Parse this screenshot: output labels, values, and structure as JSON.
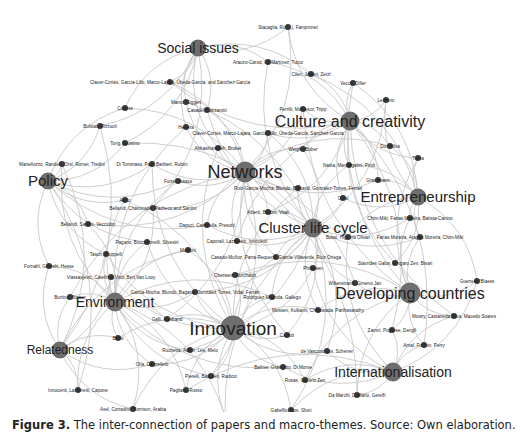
{
  "figure": {
    "caption_label": "Figure 3.",
    "caption_text": " The inter-connection of papers and macro-themes. Source: Own elaboration."
  },
  "colors": {
    "edge": "#c8c8c8",
    "theme_node": "#6e6e6e",
    "paper_node": "#3a3a3a",
    "label": "#222222"
  },
  "themes": [
    {
      "id": "social",
      "label": "Social issues",
      "x": 198,
      "y": 48,
      "r": 8,
      "fs": 14
    },
    {
      "id": "culture",
      "label": "Culture and creativity",
      "x": 350,
      "y": 121,
      "r": 9,
      "fs": 16
    },
    {
      "id": "policy",
      "label": "Policy",
      "x": 48,
      "y": 181,
      "r": 8,
      "fs": 15
    },
    {
      "id": "networks",
      "label": "Networks",
      "x": 245,
      "y": 172,
      "r": 10,
      "fs": 18
    },
    {
      "id": "entre",
      "label": "Entrepreneurship",
      "x": 418,
      "y": 197,
      "r": 8,
      "fs": 15
    },
    {
      "id": "cluster",
      "label": "Cluster life cycle",
      "x": 313,
      "y": 228,
      "r": 9,
      "fs": 15
    },
    {
      "id": "developing",
      "label": "Developing countries",
      "x": 410,
      "y": 293,
      "r": 10,
      "fs": 16
    },
    {
      "id": "environment",
      "label": "Environment",
      "x": 115,
      "y": 302,
      "r": 9,
      "fs": 14
    },
    {
      "id": "innovation",
      "label": "Innovation",
      "x": 233,
      "y": 328,
      "r": 12,
      "fs": 19
    },
    {
      "id": "relatedness",
      "label": "Relatedness",
      "x": 60,
      "y": 350,
      "r": 8,
      "fs": 12
    },
    {
      "id": "intl",
      "label": "Internationalisation",
      "x": 393,
      "y": 372,
      "r": 9,
      "fs": 14
    }
  ],
  "papers": [
    {
      "label": "Stacaglia, Ro(…), Fampronet",
      "x": 288,
      "y": 27
    },
    {
      "label": "Arauzo-Carod, Gil-Martínez, Turco",
      "x": 268,
      "y": 62
    },
    {
      "label": "Cilen, Jodlen, Zetzl",
      "x": 311,
      "y": 74
    },
    {
      "label": "Vecco, Diller",
      "x": 353,
      "y": 83
    },
    {
      "label": "Leorano",
      "x": 386,
      "y": 100
    },
    {
      "label": "Claver-Cortés, García-Lillo, Marco-Lajara, Úbeda-García, and Sánchez-García",
      "x": 170,
      "y": 82
    },
    {
      "label": "Mamo, Giggeri",
      "x": 186,
      "y": 102
    },
    {
      "label": "Perrilli, Montesor, Tripp",
      "x": 303,
      "y": 109
    },
    {
      "label": "Corless",
      "x": 125,
      "y": 108
    },
    {
      "label": "Casadei, Lazzarotti",
      "x": 207,
      "y": 110
    },
    {
      "label": "Bulsiaz, Rizzuoli",
      "x": 100,
      "y": 126
    },
    {
      "label": "Herrera",
      "x": 186,
      "y": 127
    },
    {
      "label": "Claver-Cortés, Marco-Lajara, García-Lillo, Úbeda-García, Sánchez-García",
      "x": 268,
      "y": 133
    },
    {
      "label": "Dos Silva",
      "x": 390,
      "y": 146
    },
    {
      "label": "Tong, Giustino",
      "x": 125,
      "y": 143
    },
    {
      "label": "Abbasiharofteh, Broker",
      "x": 218,
      "y": 148
    },
    {
      "label": "Weight, Bober",
      "x": 303,
      "y": 149
    },
    {
      "label": "Tuma",
      "x": 418,
      "y": 158
    },
    {
      "label": "Martellozzo, Randelli, Orsi, Romei, Tredini",
      "x": 62,
      "y": 164
    },
    {
      "label": "Di Tommaso, Paci, Barbieri, Rubini",
      "x": 152,
      "y": 164
    },
    {
      "label": "Nasta, Mannegalini, Piroli",
      "x": 349,
      "y": 165
    },
    {
      "label": "Furrer, Isaacs",
      "x": 178,
      "y": 181
    },
    {
      "label": "Grassmann",
      "x": 378,
      "y": 180
    },
    {
      "label": "Ruiz-Garcia-Mocha, Blundo, Bignardi, González-Torres, Ferrari",
      "x": 298,
      "y": 188
    },
    {
      "label": "Corsi",
      "x": 343,
      "y": 198
    },
    {
      "label": "Alberti, Belloni, Vitali",
      "x": 268,
      "y": 212
    },
    {
      "label": "Aiello",
      "x": 125,
      "y": 200
    },
    {
      "label": "Bellandi, Chaminade, Pacheco and Santini",
      "x": 153,
      "y": 208
    },
    {
      "label": "Chim-Miki, Farias Moreira, Batista-Canino",
      "x": 410,
      "y": 218
    },
    {
      "label": "Bellandi, Santini, Vecciolini",
      "x": 88,
      "y": 224
    },
    {
      "label": "Dapuci, Casabella, Presutti",
      "x": 207,
      "y": 225
    },
    {
      "label": "Bossi, Higuera Olivari",
      "x": 348,
      "y": 237
    },
    {
      "label": "Farias Moreira, Aragão Moreira, Chim-Miki",
      "x": 420,
      "y": 237
    },
    {
      "label": "Pagano, Boccadonelli, Silvestri",
      "x": 147,
      "y": 242
    },
    {
      "label": "Caporali, Lazzeretti, Innocenti",
      "x": 237,
      "y": 241
    },
    {
      "label": "Mancini",
      "x": 188,
      "y": 250
    },
    {
      "label": "Casado-Muñoz, Parra-Requena, García-Villaverde, Ruiz Ortega",
      "x": 276,
      "y": 257
    },
    {
      "label": "Tasch, Giuppelli",
      "x": 106,
      "y": 254
    },
    {
      "label": "Stavrides Galos, Gingaro Zen, Bisari",
      "x": 395,
      "y": 263
    },
    {
      "label": "Phillipsen",
      "x": 313,
      "y": 268
    },
    {
      "label": "Fornahl, Goroshi, Hesse",
      "x": 49,
      "y": 266
    },
    {
      "label": "Viassavjevic, Catellnos Vitto, Bert Van Looy",
      "x": 111,
      "y": 277
    },
    {
      "label": "Oberweis, Burchardt",
      "x": 235,
      "y": 275
    },
    {
      "label": "Wiltenstrand, Gimeno Jan",
      "x": 355,
      "y": 283
    },
    {
      "label": "Guerrero, Blaess",
      "x": 477,
      "y": 281
    },
    {
      "label": "Garcia-Mocha, Blundo, Bagardi, González Torres, Vidal, Ferrari",
      "x": 195,
      "y": 292
    },
    {
      "label": "Burtina, Bosser",
      "x": 70,
      "y": 297
    },
    {
      "label": "Rodriguez-Miranda, Gallego",
      "x": 272,
      "y": 297
    },
    {
      "label": "Mossen, Kulkarni, Chinowada, Parthasarathy",
      "x": 318,
      "y": 310
    },
    {
      "label": "Galli, Abisband",
      "x": 167,
      "y": 319
    },
    {
      "label": "Mowry, Castaneda Silva, Macedo Soares",
      "x": 454,
      "y": 316
    },
    {
      "label": "Zamni, Pugliese, Dengfi",
      "x": 392,
      "y": 330
    },
    {
      "label": "Bellsi",
      "x": 118,
      "y": 338
    },
    {
      "label": "Ruchetta, Adder, Lee, Melo",
      "x": 190,
      "y": 350
    },
    {
      "label": "Cainoti",
      "x": 287,
      "y": 335
    },
    {
      "label": "Arnal, Fishbin, Perry",
      "x": 424,
      "y": 345
    },
    {
      "label": "Olla, Cappelletti",
      "x": 152,
      "y": 364
    },
    {
      "label": "de Vasconcelos, Scherrer",
      "x": 327,
      "y": 351
    },
    {
      "label": "Baliner, Grassetto, Di Monte",
      "x": 283,
      "y": 367
    },
    {
      "label": "Pierelli, Basstieri, Radicio",
      "x": 211,
      "y": 376
    },
    {
      "label": "Rosas, Castelo Zen",
      "x": 305,
      "y": 380
    },
    {
      "label": "Innocenti, Lazzeretti, Capone",
      "x": 78,
      "y": 390
    },
    {
      "label": "Pagliaro, Russo",
      "x": 186,
      "y": 390
    },
    {
      "label": "Da Marchi, Di Mario, Gereffi",
      "x": 357,
      "y": 395
    },
    {
      "label": "Axel, Corradini, Morrison, Arabia",
      "x": 133,
      "y": 409
    },
    {
      "label": "Gabelfio, Dos, Sfuni",
      "x": 291,
      "y": 410
    },
    {
      "label": "Hernan-Glen, Ripoll",
      "x": 225,
      "y": 416
    }
  ]
}
